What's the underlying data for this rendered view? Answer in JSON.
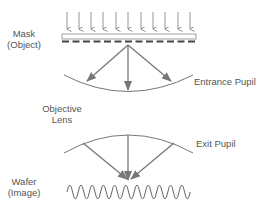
{
  "diagram": {
    "labels": {
      "mask": {
        "line1": "Mask",
        "line2": "(Object)"
      },
      "objective_lens": {
        "line1": "Objective",
        "line2": "Lens"
      },
      "wafer": {
        "line1": "Wafer",
        "line2": "(Image)"
      },
      "entrance_pupil": "Entrance Pupil",
      "exit_pupil": "Exit Pupil"
    },
    "colors": {
      "stroke": "#666666",
      "arrow": "#777777",
      "text": "#555555",
      "background": "#ffffff"
    },
    "illumination_arrow_count": 11,
    "mask_dash_count": 13,
    "diffracted_ray_count": 3,
    "converging_ray_count": 3,
    "image_wave_cycles": 11
  }
}
